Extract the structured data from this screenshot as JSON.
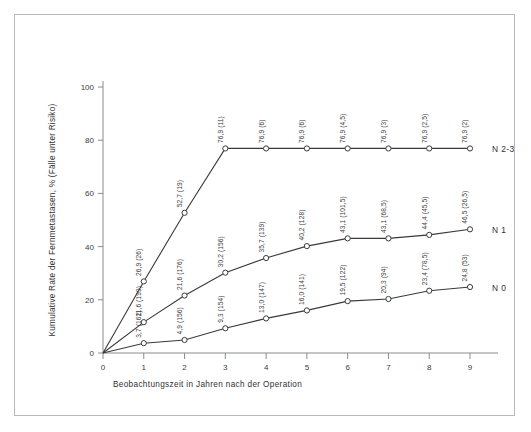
{
  "chart_data": {
    "type": "line",
    "title": "",
    "xlabel": "Beobachtungszeit in Jahren nach der Operation",
    "ylabel": "Kumulative Rate der Fernmetastasen, % (Fälle unter Risiko)",
    "x": [
      0,
      1,
      2,
      3,
      4,
      5,
      6,
      7,
      8,
      9
    ],
    "xlim": [
      0,
      9
    ],
    "ylim": [
      0,
      100
    ],
    "xticklabels": [
      "0",
      "1",
      "2",
      "3",
      "4",
      "5",
      "6",
      "7",
      "8",
      "9"
    ],
    "yticklabels": [
      "0",
      "20",
      "40",
      "60",
      "80",
      "100"
    ],
    "yticks": [
      0,
      20,
      40,
      60,
      80,
      100
    ],
    "grid": false,
    "legend_position": "right-inline",
    "marker": "open-circle",
    "color": "#3a3a3c",
    "series": [
      {
        "name": "N 2-3",
        "label": "N 2-3",
        "values": [
          0,
          26.9,
          52.7,
          76.9,
          76.9,
          76.9,
          76.9,
          76.9,
          76.9,
          76.9
        ],
        "at_risk": [
          "",
          "26",
          "19",
          "11",
          "6",
          "6",
          "4,5",
          "3",
          "2,5",
          "2"
        ],
        "point_labels": [
          "",
          "26,9 (26)",
          "52,7 (19)",
          "76,9 (11)",
          "76,9 (6)",
          "76,9 (6)",
          "76,9 (4,5)",
          "76,9 (3)",
          "76,9 (2,5)",
          "76,9 (2)"
        ]
      },
      {
        "name": "N 1",
        "label": "N 1",
        "values": [
          0,
          11.6,
          21.6,
          30.2,
          35.7,
          40.2,
          43.1,
          43.1,
          44.4,
          46.5
        ],
        "at_risk": [
          "",
          "199",
          "176",
          "156",
          "139",
          "128",
          "101,5",
          "68,5",
          "45,5",
          "26,5"
        ],
        "point_labels": [
          "",
          "11,6 (199)",
          "21,6 (176)",
          "30,2 (156)",
          "35,7 (139)",
          "40,2 (128)",
          "43,1 (101,5)",
          "43,1 (68,5)",
          "44,4 (45,5)",
          "46,5 (26,5)"
        ]
      },
      {
        "name": "N 0",
        "label": "N 0",
        "values": [
          0,
          3.7,
          4.9,
          9.3,
          13.0,
          16.0,
          19.5,
          20.3,
          23.4,
          24.8
        ],
        "at_risk": [
          "",
          "162",
          "156",
          "154",
          "147",
          "141",
          "122",
          "94",
          "78,5",
          "53"
        ],
        "point_labels": [
          "",
          "3,7 (162)",
          "4,9 (156)",
          "9,3 (154)",
          "13,0 (147)",
          "16,0 (141)",
          "19,5 (122)",
          "20,3 (94)",
          "23,4 (78,5)",
          "24,8 (53)"
        ]
      }
    ]
  },
  "figure": {
    "frame_color": "#b9b9bb",
    "background": "#ffffff",
    "ink_color": "#3a3a3c"
  }
}
